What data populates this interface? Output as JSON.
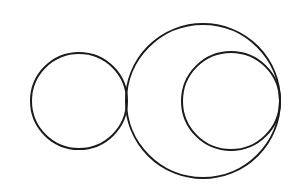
{
  "diagram": {
    "width": 298,
    "height": 192,
    "background": "#ffffff",
    "stroke_color": "#1a1a1a",
    "stroke_width": 2,
    "circles": [
      {
        "name": "left-circle",
        "cx": 79,
        "cy": 101,
        "r": 48
      },
      {
        "name": "large-circle",
        "cx": 203,
        "cy": 101,
        "r": 77
      },
      {
        "name": "inner-right-circle",
        "cx": 231,
        "cy": 101,
        "r": 49
      }
    ]
  }
}
